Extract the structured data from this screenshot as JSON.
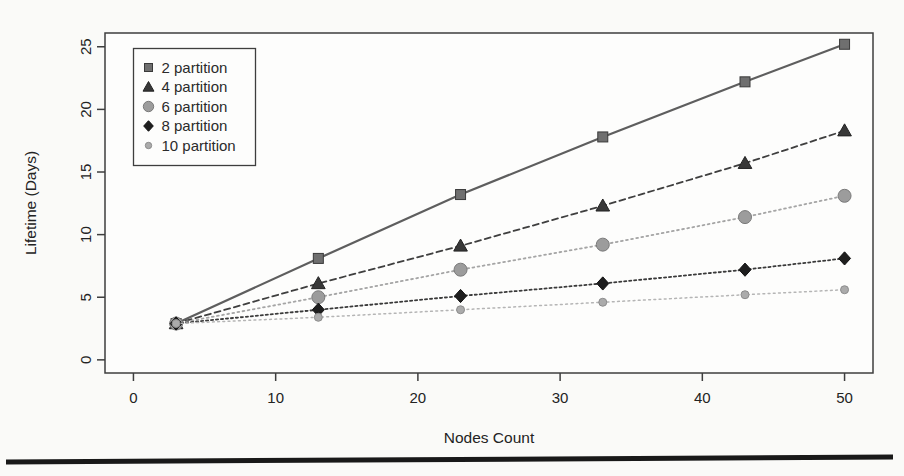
{
  "page": {
    "divider_bar_color": "#191919"
  },
  "colors": {
    "page_background": "#fafaf8",
    "plot_background": "#fdfdfc",
    "frame": "#3e3e3e",
    "text": "#232323"
  },
  "chart_data": {
    "type": "line",
    "title": "",
    "xlabel": "Nodes Count",
    "ylabel": "Lifetime (Days)",
    "x": [
      3,
      13,
      23,
      33,
      43,
      50
    ],
    "series": [
      {
        "name": "2 partition",
        "values": [
          2.9,
          8.1,
          13.2,
          17.8,
          22.2,
          25.2
        ],
        "line_style": "solid",
        "line_width": 2.2,
        "color": "#5e5e5e",
        "marker": "square",
        "marker_size": 10,
        "marker_color": "#6f6f6f",
        "marker_edge": "#3a3a3a"
      },
      {
        "name": "4 partition",
        "values": [
          2.9,
          6.1,
          9.1,
          12.3,
          15.7,
          18.3
        ],
        "line_style": "dashed",
        "line_width": 1.8,
        "color": "#3f3f3f",
        "marker": "triangle",
        "marker_size": 13,
        "marker_color": "#383838",
        "marker_edge": "#222222"
      },
      {
        "name": "6 partition",
        "values": [
          2.9,
          5.0,
          7.2,
          9.2,
          11.4,
          13.1
        ],
        "line_style": "dotted",
        "line_width": 1.8,
        "color": "#a5a5a5",
        "marker": "circle",
        "marker_size": 13,
        "marker_color": "#9c9c9c",
        "marker_edge": "#7a7a7a"
      },
      {
        "name": "8 partition",
        "values": [
          2.9,
          4.0,
          5.1,
          6.1,
          7.2,
          8.1
        ],
        "line_style": "dotted-dense",
        "line_width": 1.8,
        "color": "#3a3a3a",
        "marker": "diamond",
        "marker_size": 12,
        "marker_color": "#1e1e1e",
        "marker_edge": "#111111"
      },
      {
        "name": "10 partition",
        "values": [
          2.9,
          3.4,
          4.0,
          4.6,
          5.2,
          5.6
        ],
        "line_style": "dotted",
        "line_width": 1.5,
        "color": "#b5b5b5",
        "marker": "circle",
        "marker_size": 8,
        "marker_color": "#ababab",
        "marker_edge": "#8c8c8c"
      }
    ],
    "x_ticks": [
      0,
      10,
      20,
      30,
      40,
      50
    ],
    "y_ticks": [
      0,
      5,
      10,
      15,
      20,
      25
    ],
    "xlim": [
      -2,
      52
    ],
    "ylim": [
      -1.05,
      26.1
    ],
    "grid": false,
    "legend_position": "top-left"
  }
}
